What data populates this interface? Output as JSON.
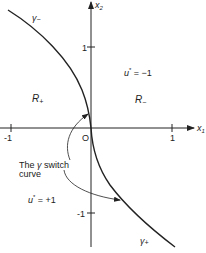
{
  "diagram": {
    "type": "phase-plane switching curve",
    "axes": {
      "x_label": "x",
      "x_sub": "1",
      "y_label": "x",
      "y_sub": "2",
      "x_ticks": [
        "-1",
        "1"
      ],
      "y_ticks": [
        "1",
        "-1"
      ],
      "origin_label": "O"
    },
    "curves": {
      "gamma_minus": {
        "symbol": "γ",
        "sub": "−"
      },
      "gamma_plus": {
        "symbol": "γ",
        "sub": "+"
      }
    },
    "regions": {
      "r_plus": {
        "symbol": "R",
        "sub": "+"
      },
      "r_minus": {
        "symbol": "R",
        "sub": "−"
      }
    },
    "controls": {
      "u_minus": {
        "symbol": "u",
        "sup": "*",
        "value": " = −1"
      },
      "u_plus": {
        "symbol": "u",
        "sup": "*",
        "value": " = +1"
      }
    },
    "annotation": {
      "line1_pre": "The ",
      "line1_gamma": "γ",
      "line1_post": " switch",
      "line2": "curve"
    },
    "colors": {
      "ink": "#222222",
      "background": "#ffffff"
    }
  }
}
